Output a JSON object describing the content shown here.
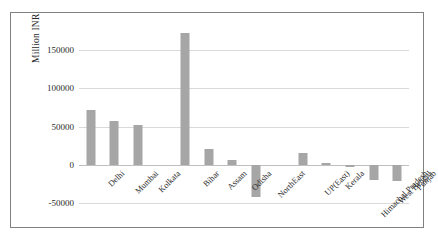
{
  "chart_data": {
    "type": "bar",
    "title": "",
    "xlabel": "",
    "ylabel": "Million INR",
    "ylim": [
      -50000,
      175000
    ],
    "yticks": [
      150000,
      100000,
      50000,
      0,
      -50000
    ],
    "ytick_labels": [
      "150000",
      "100000",
      "50000",
      "0",
      "-50000"
    ],
    "grid": true,
    "legend": "none",
    "bar_color": "#a6a6a6",
    "categories": [
      "Delhi",
      "Mumbai",
      "Kolkata",
      "",
      "Bihar",
      "Assam",
      "Odisha",
      "NorthEast",
      "",
      "UP(East)",
      "Kerala",
      "Himachal Pradesh",
      "West Bengal",
      "Punjab"
    ],
    "values": [
      72000,
      57000,
      52000,
      null,
      172000,
      21000,
      6000,
      -42000,
      null,
      15000,
      2500,
      -2500,
      -20000,
      -21000
    ],
    "series": [
      {
        "name": "Million INR",
        "values": [
          72000,
          57000,
          52000,
          null,
          172000,
          21000,
          6000,
          -42000,
          null,
          15000,
          2500,
          -2500,
          -20000,
          -21000
        ]
      }
    ]
  }
}
